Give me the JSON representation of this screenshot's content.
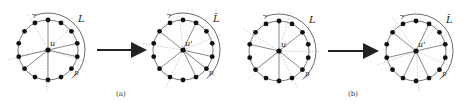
{
  "figure": {
    "panels": [
      {
        "id": "a-before",
        "center_label": "u",
        "arc_label": "L",
        "arc_end_label": "p",
        "cx": 48,
        "cy": 50
      },
      {
        "id": "a-after",
        "center_label": "u'",
        "arc_label": "L̂",
        "arc_end_label": "p",
        "cx": 183,
        "cy": 50
      },
      {
        "id": "b-before",
        "center_label": "u",
        "arc_label": "L",
        "arc_end_label": "p",
        "cx": 279,
        "cy": 51
      },
      {
        "id": "b-after",
        "center_label": "u'",
        "arc_label": "L̂",
        "arc_end_label": "p",
        "cx": 416,
        "cy": 51
      }
    ],
    "captions": [
      {
        "text": "(a)",
        "x": 118,
        "y": 96
      },
      {
        "text": "(b)",
        "x": 350,
        "y": 96
      }
    ],
    "colors": {
      "node": "#111111",
      "edge": "#555555",
      "dotted": "#999999",
      "arrow": "#222222"
    }
  }
}
